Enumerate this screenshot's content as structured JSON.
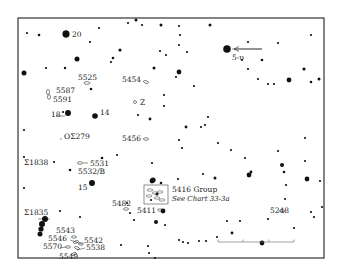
{
  "chart": {
    "frame": {
      "x": 18,
      "y": 18,
      "w": 306,
      "h": 240,
      "stroke": "#333333"
    },
    "star_color": "#111111",
    "stars": [
      [
        27,
        33,
        1.1
      ],
      [
        39,
        35,
        1.3
      ],
      [
        66,
        34,
        3.4
      ],
      [
        99,
        28,
        1.1
      ],
      [
        128,
        23,
        1.1
      ],
      [
        136,
        20,
        1.5
      ],
      [
        142,
        25,
        1.1
      ],
      [
        161,
        25,
        1.5
      ],
      [
        90,
        42,
        1.1
      ],
      [
        120,
        50,
        1.6
      ],
      [
        113,
        58,
        1.3
      ],
      [
        111,
        62,
        1.1
      ],
      [
        77,
        59,
        2.5
      ],
      [
        46,
        68,
        1.1
      ],
      [
        65,
        68,
        1.2
      ],
      [
        24,
        73,
        2.5
      ],
      [
        154,
        68,
        1.5
      ],
      [
        160,
        51,
        1.1
      ],
      [
        166,
        55,
        1.1
      ],
      [
        179,
        26,
        1.1
      ],
      [
        180,
        35,
        1.1
      ],
      [
        187,
        52,
        1.1
      ],
      [
        179,
        45,
        1.1
      ],
      [
        210,
        25,
        1.5
      ],
      [
        227,
        49,
        2.0
      ],
      [
        248,
        42,
        1.1
      ],
      [
        242,
        60,
        1.1
      ],
      [
        248,
        69,
        1.1
      ],
      [
        258,
        79,
        1.1
      ],
      [
        268,
        84,
        1.1
      ],
      [
        274,
        84,
        1.1
      ],
      [
        289,
        80,
        2.4
      ],
      [
        311,
        82,
        1.3
      ],
      [
        319,
        79,
        1.5
      ],
      [
        304,
        69,
        1.6
      ],
      [
        311,
        35,
        1.1
      ],
      [
        278,
        43,
        1.1
      ],
      [
        179,
        72,
        2.4
      ],
      [
        176,
        77,
        1.1
      ],
      [
        194,
        86,
        1.1
      ],
      [
        262,
        60,
        1.3
      ],
      [
        91,
        89,
        1.3
      ],
      [
        63,
        112,
        1.1
      ],
      [
        24,
        130,
        1.1
      ],
      [
        150,
        119,
        1.4
      ],
      [
        164,
        95,
        1.1
      ],
      [
        164,
        106,
        1.1
      ],
      [
        138,
        115,
        1.1
      ],
      [
        186,
        127,
        1.4
      ],
      [
        179,
        140,
        1.1
      ],
      [
        208,
        117,
        1.1
      ],
      [
        205,
        125,
        1.1
      ],
      [
        201,
        127,
        1.1
      ],
      [
        182,
        148,
        1.1
      ],
      [
        218,
        143,
        1.1
      ],
      [
        231,
        150,
        1.1
      ],
      [
        245,
        158,
        1.1
      ],
      [
        251,
        172,
        1.4
      ],
      [
        278,
        151,
        1.1
      ],
      [
        305,
        138,
        1.1
      ],
      [
        305,
        161,
        1.1
      ],
      [
        24,
        157,
        1.1
      ],
      [
        54,
        162,
        1.1
      ],
      [
        70,
        170,
        1.3
      ],
      [
        102,
        158,
        1.3
      ],
      [
        117,
        155,
        1.1
      ],
      [
        152,
        163,
        1.1
      ],
      [
        152,
        181,
        2.4
      ],
      [
        178,
        179,
        1.1
      ],
      [
        203,
        174,
        1.1
      ],
      [
        215,
        178,
        1.5
      ],
      [
        249,
        175,
        2.4
      ],
      [
        282,
        165,
        2.0
      ],
      [
        284,
        172,
        1.3
      ],
      [
        286,
        185,
        1.1
      ],
      [
        307,
        179,
        2.4
      ],
      [
        320,
        181,
        1.1
      ],
      [
        285,
        199,
        1.1
      ],
      [
        311,
        212,
        1.1
      ],
      [
        314,
        217,
        1.1
      ],
      [
        322,
        207,
        1.1
      ],
      [
        268,
        219,
        1.1
      ],
      [
        240,
        221,
        1.1
      ],
      [
        227,
        221,
        1.1
      ],
      [
        232,
        233,
        1.4
      ],
      [
        262,
        243,
        2.4
      ],
      [
        294,
        228,
        1.1
      ],
      [
        24,
        188,
        1.1
      ],
      [
        60,
        211,
        1.1
      ],
      [
        80,
        217,
        1.1
      ],
      [
        127,
        203,
        1.1
      ],
      [
        130,
        213,
        1.1
      ],
      [
        134,
        220,
        1.1
      ],
      [
        156,
        222,
        2.0
      ],
      [
        161,
        183,
        1.3
      ],
      [
        163,
        211,
        1.1
      ],
      [
        165,
        225,
        1.1
      ],
      [
        157,
        194,
        1.6
      ],
      [
        151,
        200,
        1.1
      ],
      [
        121,
        245,
        1.1
      ],
      [
        148,
        246,
        1.1
      ],
      [
        155,
        258,
        1.1
      ],
      [
        149,
        253,
        1.1
      ],
      [
        179,
        240,
        1.1
      ],
      [
        199,
        241,
        1.1
      ],
      [
        206,
        241,
        1.1
      ],
      [
        217,
        237,
        1.1
      ],
      [
        183,
        242,
        1.1
      ],
      [
        188,
        243,
        1.1
      ]
    ],
    "bright_stars": [
      {
        "x": 66,
        "y": 34,
        "r": 3.4
      },
      {
        "x": 227,
        "y": 49,
        "r": 3.8
      },
      {
        "x": 68,
        "y": 113,
        "r": 3.0
      },
      {
        "x": 95,
        "y": 116,
        "r": 2.8
      },
      {
        "x": 92,
        "y": 183,
        "r": 3.0
      },
      {
        "x": 45,
        "y": 219,
        "r": 3.0
      },
      {
        "x": 42,
        "y": 224,
        "r": 3.0
      },
      {
        "x": 41,
        "y": 229,
        "r": 2.6
      },
      {
        "x": 40,
        "y": 234,
        "r": 2.5
      },
      {
        "x": 163,
        "y": 211,
        "r": 2.4
      },
      {
        "x": 153,
        "y": 180,
        "r": 2.6
      }
    ],
    "labels": [
      {
        "text": "20",
        "x": 72,
        "y": 37
      },
      {
        "text": "5-υ",
        "x": 232,
        "y": 60
      },
      {
        "text": "5525",
        "x": 78,
        "y": 80
      },
      {
        "text": "5454",
        "x": 122,
        "y": 82
      },
      {
        "text": "5587",
        "x": 56,
        "y": 93
      },
      {
        "text": "5591",
        "x": 53,
        "y": 102
      },
      {
        "text": "Z",
        "x": 140,
        "y": 105
      },
      {
        "text": "18",
        "x": 51,
        "y": 117
      },
      {
        "text": "14",
        "x": 100,
        "y": 115
      },
      {
        "text": "ΟΣ279",
        "x": 64,
        "y": 139
      },
      {
        "text": "5456",
        "x": 122,
        "y": 141
      },
      {
        "text": "Σ1838",
        "x": 24,
        "y": 165
      },
      {
        "text": "5531",
        "x": 90,
        "y": 166
      },
      {
        "text": "5532/B",
        "x": 78,
        "y": 174
      },
      {
        "text": "15",
        "x": 78,
        "y": 190
      },
      {
        "text": "5482",
        "x": 112,
        "y": 206
      },
      {
        "text": "5416 Group",
        "x": 172,
        "y": 192
      },
      {
        "text": "5411",
        "x": 137,
        "y": 213
      },
      {
        "text": "5248",
        "x": 270,
        "y": 213
      },
      {
        "text": "Σ1835",
        "x": 24,
        "y": 215
      },
      {
        "text": "5543",
        "x": 56,
        "y": 233
      },
      {
        "text": "5546",
        "x": 48,
        "y": 241
      },
      {
        "text": "5542",
        "x": 84,
        "y": 243
      },
      {
        "text": "5570",
        "x": 43,
        "y": 249
      },
      {
        "text": "5538",
        "x": 86,
        "y": 250
      },
      {
        "text": "5549",
        "x": 59,
        "y": 259
      }
    ],
    "italic_labels": [
      {
        "text": "See Chart 33-3a",
        "x": 172,
        "y": 201
      }
    ],
    "galaxies": [
      {
        "cx": 87,
        "cy": 83,
        "rx": 3,
        "ry": 1.4,
        "rot": 0
      },
      {
        "cx": 146,
        "cy": 82,
        "rx": 2.6,
        "ry": 1.3,
        "rot": 20
      },
      {
        "cx": 48,
        "cy": 92,
        "rx": 1.5,
        "ry": 2.6,
        "rot": 0
      },
      {
        "cx": 49,
        "cy": 97,
        "rx": 1.5,
        "ry": 2.4,
        "rot": 0
      },
      {
        "cx": 135,
        "cy": 102,
        "rx": 1.5,
        "ry": 1.5,
        "rot": 0
      },
      {
        "cx": 146,
        "cy": 139,
        "rx": 2.6,
        "ry": 1.3,
        "rot": 0
      },
      {
        "cx": 80,
        "cy": 163,
        "rx": 2.6,
        "ry": 1.3,
        "rot": 0
      },
      {
        "cx": 126,
        "cy": 209,
        "rx": 2.6,
        "ry": 1.3,
        "rot": 0
      },
      {
        "cx": 160,
        "cy": 210,
        "rx": 2.4,
        "ry": 1.2,
        "rot": 0
      },
      {
        "cx": 282,
        "cy": 211,
        "rx": 2.6,
        "ry": 1.3,
        "rot": 0
      },
      {
        "cx": 74,
        "cy": 237,
        "rx": 2.6,
        "ry": 1.2,
        "rot": 0
      },
      {
        "cx": 76,
        "cy": 242,
        "rx": 2.6,
        "ry": 1.2,
        "rot": -20
      },
      {
        "cx": 81,
        "cy": 244,
        "rx": 2.6,
        "ry": 1.2,
        "rot": 0
      },
      {
        "cx": 68,
        "cy": 247,
        "rx": 2.6,
        "ry": 1.2,
        "rot": 0
      },
      {
        "cx": 77,
        "cy": 248,
        "rx": 2.6,
        "ry": 1.2,
        "rot": 20
      },
      {
        "cx": 74,
        "cy": 254,
        "rx": 2.6,
        "ry": 1.2,
        "rot": -20
      }
    ],
    "group_box": {
      "x": 144,
      "y": 185,
      "w": 24,
      "h": 19
    },
    "group_box_galaxies": [
      {
        "cx": 150,
        "cy": 190,
        "rx": 3,
        "ry": 1.2,
        "rot": 0
      },
      {
        "cx": 155,
        "cy": 193,
        "rx": 3,
        "ry": 1.2,
        "rot": 0
      },
      {
        "cx": 160,
        "cy": 192,
        "rx": 3,
        "ry": 1.2,
        "rot": 0
      },
      {
        "cx": 149,
        "cy": 196,
        "rx": 3,
        "ry": 1.2,
        "rot": 0
      },
      {
        "cx": 157,
        "cy": 198,
        "rx": 3,
        "ry": 1.2,
        "rot": 0
      },
      {
        "cx": 162,
        "cy": 200,
        "rx": 3,
        "ry": 1.2,
        "rot": 0
      }
    ],
    "leader_lines": [
      [
        232,
        49,
        262,
        49
      ],
      [
        56,
        116,
        65,
        116
      ],
      [
        60,
        139,
        62,
        139
      ],
      [
        83,
        163,
        88,
        163
      ],
      [
        70,
        240,
        82,
        244
      ],
      [
        60,
        248,
        66,
        247
      ],
      [
        77,
        250,
        85,
        248
      ],
      [
        38,
        219,
        50,
        219
      ]
    ],
    "arrow": {
      "x1": 262,
      "y1": 49,
      "x2": 234,
      "y2": 49
    },
    "scale_bar": {
      "x1": 218,
      "x2": 294,
      "y": 242,
      "ticks": [
        218,
        243,
        269,
        294
      ]
    }
  }
}
